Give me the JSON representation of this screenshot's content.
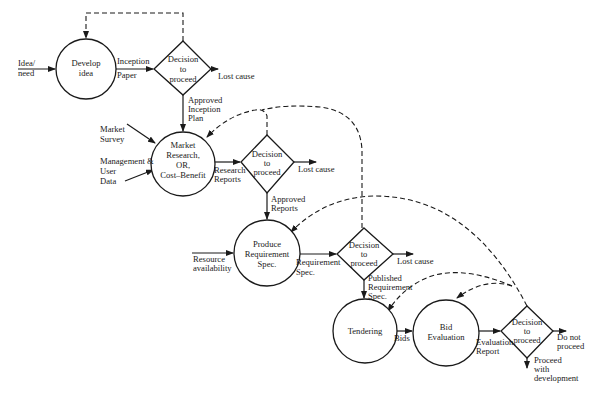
{
  "diagram": {
    "title": "",
    "nodes": {
      "develop_idea": {
        "type": "process",
        "lines": [
          "Develop",
          "idea"
        ]
      },
      "decision1": {
        "type": "decision",
        "lines": [
          "Decision",
          "to",
          "proceed"
        ]
      },
      "market_research": {
        "type": "process",
        "lines": [
          "Market",
          "Research,",
          "OR,",
          "Cost–Benefit"
        ]
      },
      "decision2": {
        "type": "decision",
        "lines": [
          "Decision",
          "to",
          "proceed"
        ]
      },
      "produce_req": {
        "type": "process",
        "lines": [
          "Produce",
          "Requirement",
          "Spec."
        ]
      },
      "decision3": {
        "type": "decision",
        "lines": [
          "Decision",
          "to",
          "proceed"
        ]
      },
      "tendering": {
        "type": "process",
        "lines": [
          "Tendering"
        ]
      },
      "bid_eval": {
        "type": "process",
        "lines": [
          "Bid",
          "Evaluation"
        ]
      },
      "decision4": {
        "type": "decision",
        "lines": [
          "Decision",
          "to",
          "proceed"
        ]
      }
    },
    "edge_labels": {
      "idea_need": [
        "Idea/",
        "need"
      ],
      "inception_paper": [
        "Inception",
        "Paper"
      ],
      "lost_cause_1": [
        "Lost cause"
      ],
      "approved_inception_plan": [
        "Approved",
        "Inception",
        "Plan"
      ],
      "market_survey": [
        "Market",
        "Survey"
      ],
      "management_user_data": [
        "Management &",
        "User",
        "Data"
      ],
      "research_reports": [
        "Research",
        "Reports"
      ],
      "lost_cause_2": [
        "Lost cause"
      ],
      "approved_reports": [
        "Approved",
        "Reports"
      ],
      "resource_availability": [
        "Resource",
        "availability"
      ],
      "requirement_spec": [
        "Requirement",
        "Spec."
      ],
      "lost_cause_3": [
        "Lost cause"
      ],
      "published_requirement_spec": [
        "Published",
        "Requirement",
        "Spec."
      ],
      "bids": [
        "Bids"
      ],
      "evaluation_report": [
        "Evaluation",
        "Report"
      ],
      "do_not_proceed": [
        "Do not",
        "proceed"
      ],
      "proceed_with_development": [
        "Proceed",
        "with",
        "development"
      ]
    },
    "colors": {
      "ink": "#1a1a1a",
      "background": "#ffffff"
    }
  }
}
